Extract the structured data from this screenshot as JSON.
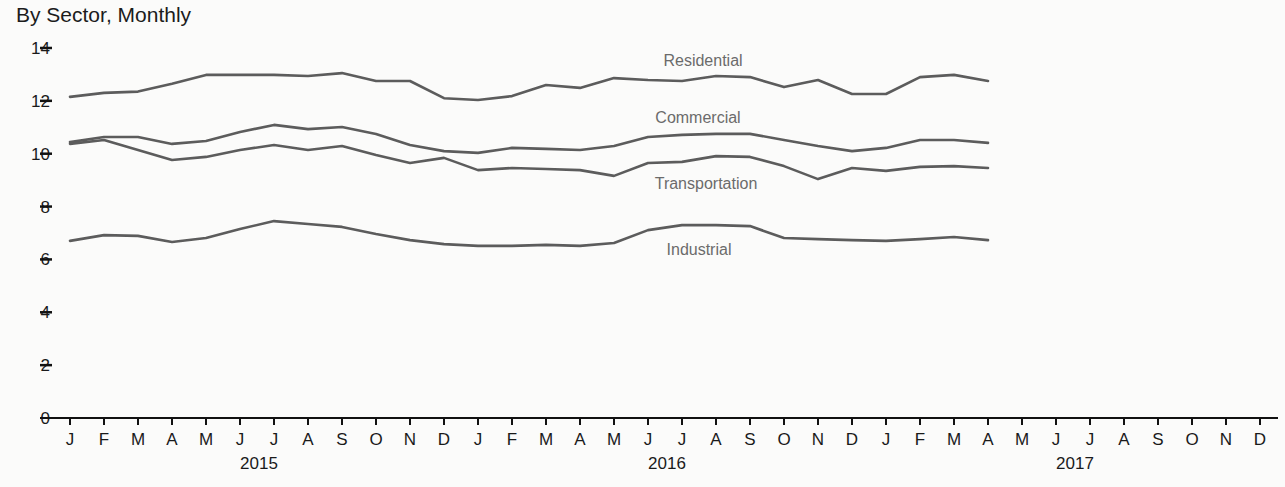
{
  "chart_data": {
    "type": "line",
    "title": "By Sector, Monthly",
    "xlabel": "",
    "ylabel": "",
    "ylim": [
      0,
      14
    ],
    "yticks": [
      0,
      2,
      4,
      6,
      8,
      10,
      12,
      14
    ],
    "grid": false,
    "legend_position": "inline labels",
    "x_month_labels": [
      "J",
      "F",
      "M",
      "A",
      "M",
      "J",
      "J",
      "A",
      "S",
      "O",
      "N",
      "D",
      "J",
      "F",
      "M",
      "A",
      "M",
      "J",
      "J",
      "A",
      "S",
      "O",
      "N",
      "D",
      "J",
      "F",
      "M",
      "A",
      "M",
      "J",
      "J",
      "A",
      "S",
      "O",
      "N",
      "D"
    ],
    "x_year_labels": [
      {
        "label": "2015",
        "center_index": 5.5
      },
      {
        "label": "2016",
        "center_index": 17.5
      },
      {
        "label": "2017",
        "center_index": 29.5
      }
    ],
    "x": [
      "2015-01",
      "2015-02",
      "2015-03",
      "2015-04",
      "2015-05",
      "2015-06",
      "2015-07",
      "2015-08",
      "2015-09",
      "2015-10",
      "2015-11",
      "2015-12",
      "2016-01",
      "2016-02",
      "2016-03",
      "2016-04",
      "2016-05",
      "2016-06",
      "2016-07",
      "2016-08",
      "2016-09",
      "2016-10",
      "2016-11",
      "2016-12",
      "2017-01",
      "2017-02",
      "2017-03",
      "2017-04"
    ],
    "series": [
      {
        "name": "Residential",
        "label_pos": [
          703,
          66
        ],
        "values": [
          12.15,
          12.3,
          12.35,
          12.65,
          12.98,
          12.98,
          12.98,
          12.94,
          13.05,
          12.75,
          12.75,
          12.1,
          12.03,
          12.18,
          12.6,
          12.49,
          12.86,
          12.79,
          12.75,
          12.94,
          12.9,
          12.52,
          12.79,
          12.26,
          12.26,
          12.9,
          12.98,
          12.75
        ]
      },
      {
        "name": "Commercial",
        "label_pos": [
          698,
          123
        ],
        "values": [
          10.44,
          10.63,
          10.63,
          10.37,
          10.48,
          10.82,
          11.09,
          10.93,
          11.01,
          10.75,
          10.33,
          10.1,
          10.03,
          10.22,
          10.18,
          10.14,
          10.29,
          10.63,
          10.71,
          10.75,
          10.75,
          10.52,
          10.29,
          10.1,
          10.22,
          10.52,
          10.52,
          10.41
        ]
      },
      {
        "name": "Transportation",
        "label_pos": [
          706,
          189
        ],
        "values": [
          10.37,
          10.52,
          10.14,
          9.76,
          9.88,
          10.14,
          10.33,
          10.14,
          10.29,
          9.95,
          9.65,
          9.84,
          9.38,
          9.46,
          9.42,
          9.38,
          9.16,
          9.65,
          9.69,
          9.91,
          9.88,
          9.53,
          9.04,
          9.46,
          9.35,
          9.5,
          9.53,
          9.46
        ]
      },
      {
        "name": "Industrial",
        "label_pos": [
          699,
          255
        ],
        "values": [
          6.7,
          6.92,
          6.89,
          6.66,
          6.81,
          7.15,
          7.45,
          7.34,
          7.23,
          6.96,
          6.73,
          6.58,
          6.51,
          6.51,
          6.55,
          6.51,
          6.62,
          7.11,
          7.3,
          7.3,
          7.26,
          6.81,
          6.77,
          6.73,
          6.7,
          6.77,
          6.85,
          6.73
        ]
      }
    ],
    "colors": {
      "line": "#5c5c5c",
      "axis": "#111111",
      "label": "#6b6b6b"
    }
  }
}
